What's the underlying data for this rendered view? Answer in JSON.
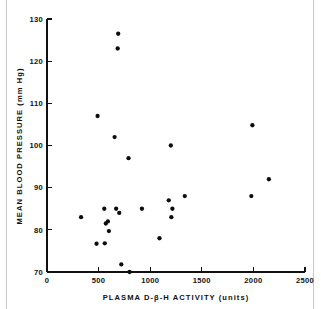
{
  "chart_data": {
    "type": "scatter",
    "title": "",
    "xlabel": "PLASMA D-β-H ACTIVITY (units)",
    "ylabel": "MEAN BLOOD PRESSURE (mm Hg)",
    "xlim": [
      0,
      2500
    ],
    "ylim": [
      70,
      130
    ],
    "xticks": [
      0,
      500,
      1000,
      1500,
      2000,
      2500
    ],
    "yticks": [
      70,
      80,
      90,
      100,
      110,
      120,
      130
    ],
    "xtick_labels": [
      "0",
      "500",
      "1000",
      "1500",
      "2000",
      "2500"
    ],
    "ytick_labels": [
      "70",
      "80",
      "90",
      "100",
      "110",
      "120",
      "130"
    ],
    "grid": false,
    "legend": false,
    "marker": "filled-circle",
    "marker_color": "#0d0d0d",
    "marker_size": 3.6,
    "axis_color": "#111111",
    "background_color": "#ffffff",
    "series": [
      {
        "name": "patients",
        "points": [
          [
            330,
            83.0
          ],
          [
            480,
            76.7
          ],
          [
            490,
            107.0
          ],
          [
            555,
            85.0
          ],
          [
            560,
            76.8
          ],
          [
            570,
            81.5
          ],
          [
            590,
            82.0
          ],
          [
            600,
            79.7
          ],
          [
            655,
            102.0
          ],
          [
            670,
            85.0
          ],
          [
            685,
            123.0
          ],
          [
            690,
            126.5
          ],
          [
            700,
            84.0
          ],
          [
            720,
            71.8
          ],
          [
            790,
            97.0
          ],
          [
            800,
            70.0
          ],
          [
            920,
            85.0
          ],
          [
            1090,
            78.0
          ],
          [
            1180,
            87.0
          ],
          [
            1200,
            100.0
          ],
          [
            1205,
            83.0
          ],
          [
            1215,
            85.0
          ],
          [
            1335,
            88.0
          ],
          [
            1980,
            88.0
          ],
          [
            1990,
            104.8
          ],
          [
            2150,
            92.0
          ]
        ]
      }
    ]
  },
  "figure": {
    "xlabel_text": "PLASMA D-β-H ACTIVITY (units)",
    "ylabel_text": "MEAN BLOOD PRESSURE (mm Hg)"
  },
  "geometry": {
    "x0_px": 47,
    "x1_px": 305,
    "y0_px": 272,
    "y1_px": 19
  }
}
